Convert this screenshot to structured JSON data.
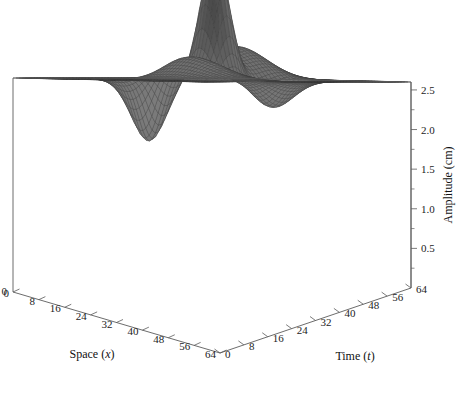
{
  "figure": {
    "type": "surface-3d",
    "background_color": "#ffffff",
    "frame_color": "#5b5b5b",
    "width": 469,
    "height": 418
  },
  "axes": {
    "x": {
      "name": "space-axis",
      "title_main": "Space (",
      "title_var": "x",
      "title_close": ")",
      "title_full": "Space (x)",
      "ticks": [
        0,
        8,
        16,
        24,
        32,
        40,
        48,
        56,
        64
      ],
      "tick_labels": [
        "0",
        "8",
        "16",
        "24",
        "32",
        "40",
        "48",
        "56",
        "64"
      ],
      "range": [
        0,
        64
      ]
    },
    "y": {
      "name": "time-axis",
      "title_main": "Time (",
      "title_var": "t",
      "title_close": ")",
      "title_full": "Time (t)",
      "ticks": [
        0,
        8,
        16,
        24,
        32,
        40,
        48,
        56,
        64
      ],
      "tick_labels": [
        "0",
        "8",
        "16",
        "24",
        "32",
        "40",
        "48",
        "56",
        "64"
      ],
      "range": [
        0,
        64
      ]
    },
    "z": {
      "name": "amplitude-axis",
      "title_full": "Amplitude (cm)",
      "ticks": [
        0.5,
        1.0,
        1.5,
        2.0,
        2.5
      ],
      "tick_labels": [
        "0.5",
        "1.0",
        "1.5",
        "2.0",
        "2.5"
      ],
      "minor_step": 0.25,
      "range": [
        0.0,
        2.6
      ]
    }
  },
  "chart_data": {
    "type": "surface",
    "title": "",
    "xlabel": "Space (x)",
    "ylabel": "Time (t)",
    "zlabel": "Amplitude (cm)",
    "xlim": [
      0,
      64
    ],
    "ylim": [
      0,
      64
    ],
    "zlim": [
      0.0,
      2.6
    ],
    "grid": false,
    "legend": "none",
    "mesh_resolution": {
      "nx": 64,
      "ny": 64
    },
    "surface_style": {
      "wireframe": true,
      "mesh_color": "#3a3a3a",
      "face_base_color": "#6a6a6a",
      "highlight_color": "#f2f2f2",
      "shadow_color": "#101010"
    },
    "model": {
      "baseline": 1.0,
      "components": [
        {
          "kind": "peak",
          "amp": 1.55,
          "x0": 33,
          "t0": 34,
          "sx": 4.2,
          "st": 5.0
        },
        {
          "kind": "hump",
          "amp": 0.42,
          "x0": 20,
          "t0": 27,
          "sx": 9.0,
          "st": 11.0
        },
        {
          "kind": "ridge",
          "amp": 0.3,
          "x0": 46,
          "t0": 40,
          "sx": 6.0,
          "st": 14.0
        },
        {
          "kind": "trough",
          "amp": -0.85,
          "x0": 44,
          "t0": 24,
          "sx": 5.0,
          "st": 6.5
        },
        {
          "kind": "trough",
          "amp": -0.35,
          "x0": 26,
          "t0": 46,
          "sx": 7.0,
          "st": 6.0
        }
      ]
    },
    "annotated_values": {
      "baseline_amplitude_cm": 1.0,
      "peak_amplitude_cm": 2.55,
      "min_amplitude_cm": 0.15
    }
  },
  "geometry": {
    "corner_back": [
      220,
      78
    ],
    "corner_left": [
      13,
      78
    ],
    "corner_right": [
      411,
      82
    ],
    "corner_front": [
      220,
      353
    ],
    "base_back": [
      220,
      14
    ],
    "z_base_left": [
      13,
      292
    ],
    "z_base_right": [
      411,
      288
    ],
    "z_top_right": [
      411,
      82
    ]
  }
}
